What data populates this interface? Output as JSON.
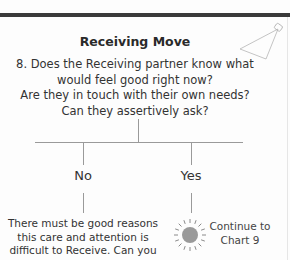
{
  "page": {
    "title": "Receiving Move",
    "question_lines": [
      "8. Does the Receiving partner know what",
      "would feel good right now?",
      "Are they in touch with their own needs?",
      "Can they assertively ask?"
    ],
    "icons": {
      "corner": "spotlight-lamp-icon",
      "yes_marker": "sun-icon"
    }
  },
  "flowchart": {
    "branches": {
      "no": {
        "label": "No",
        "text_lines": [
          "There must be good reasons",
          "this care and attention is",
          "difficult to Receive. Can you"
        ]
      },
      "yes": {
        "label": "Yes",
        "text_lines": [
          "Continue to",
          "Chart 9"
        ]
      }
    }
  },
  "colors": {
    "top_bar": "#3a3a3a",
    "lines": "#9a9a9a",
    "sun": "#9a9a9a",
    "text": "#333333"
  }
}
